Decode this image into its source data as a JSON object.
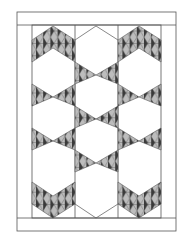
{
  "diagram": {
    "type": "quilt-pattern",
    "colors": {
      "line": "#555555",
      "light": "#bdbdbd",
      "dark": "#3a3a3a",
      "mid": "#8a8a8a",
      "bg": "#ffffff"
    },
    "outer_border": {
      "x": 17,
      "y": 12,
      "w": 159,
      "h": 219
    },
    "inner_field": {
      "x": 32,
      "y": 25,
      "w": 129,
      "h": 193
    },
    "columns_x": [
      32,
      75,
      118,
      161
    ]
  }
}
